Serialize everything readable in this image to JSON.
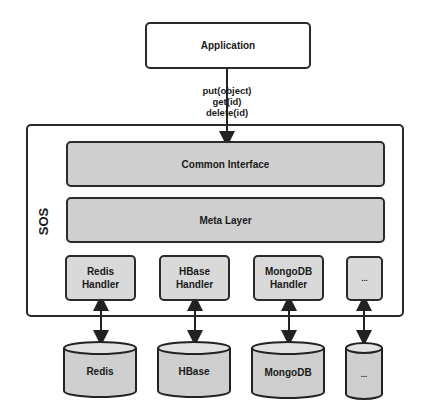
{
  "diagram": {
    "application": {
      "label": "Application"
    },
    "api_calls": [
      "put(object)",
      "get(id)",
      "delete(id)"
    ],
    "system": {
      "label": "SOS",
      "layers": [
        {
          "label": "Common Interface"
        },
        {
          "label": "Meta Layer"
        }
      ],
      "handlers": [
        {
          "line1": "Redis",
          "line2": "Handler"
        },
        {
          "line1": "HBase",
          "line2": "Handler"
        },
        {
          "line1": "MongoDB",
          "line2": "Handler"
        },
        {
          "line1": "...",
          "line2": ""
        }
      ]
    },
    "stores": [
      {
        "label": "Redis"
      },
      {
        "label": "HBase"
      },
      {
        "label": "MongoDB"
      },
      {
        "label": "..."
      }
    ]
  }
}
